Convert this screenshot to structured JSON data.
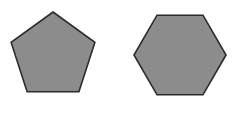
{
  "scene": {
    "title": "Two gray geometric polygons",
    "width": 242,
    "height": 115,
    "background_color": "#ffffff"
  },
  "style": {
    "fill_color": "#8c8c8c",
    "stroke_color": "#2b2b2b",
    "stroke_width": 1.6
  },
  "shapes": [
    {
      "id": "pentagon",
      "name": "pentagon",
      "sides": 5,
      "label": "Pentagon",
      "fill_color": "#8c8c8c",
      "stroke_color": "#2b2b2b",
      "center_x": 53,
      "center_y": 55,
      "radius": 43,
      "rotation_deg": -90,
      "bounds": {
        "x": 10,
        "y": 12,
        "width": 87,
        "height": 85
      },
      "points": "53,12 94.9,42.4 78.9,91.7 27.1,91.7 11.1,42.4"
    },
    {
      "id": "hexagon",
      "name": "hexagon",
      "sides": 6,
      "label": "Hexagon",
      "fill_color": "#8c8c8c",
      "stroke_color": "#2b2b2b",
      "center_x": 180,
      "center_y": 55,
      "radius": 46,
      "rotation_deg": 0,
      "bounds": {
        "x": 134,
        "y": 13,
        "width": 92,
        "height": 84
      },
      "points": "226,55 203,94.8 157,94.8 134,55 157,15.2 203,15.2"
    }
  ]
}
